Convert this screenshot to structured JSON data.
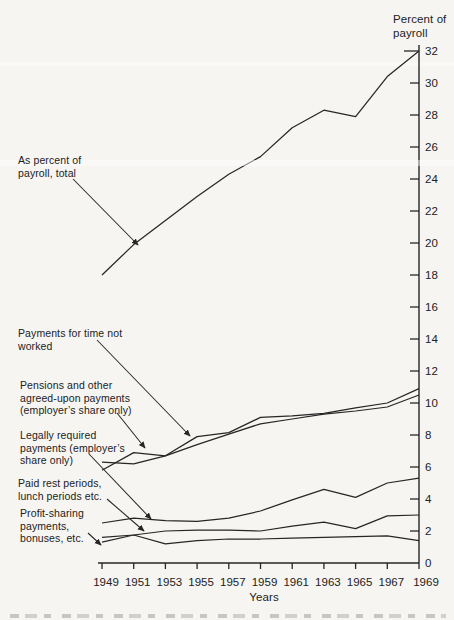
{
  "colors": {
    "ink": "#262626",
    "background": "#f6f5f2"
  },
  "y_axis": {
    "unit_label": "Percent of\npayroll",
    "tick_labels": [
      "32",
      "30",
      "28",
      "26",
      "24",
      "22",
      "20",
      "18",
      "16",
      "14",
      "12",
      "10",
      "8",
      "6",
      "4",
      "2",
      "0"
    ]
  },
  "x_axis": {
    "title": "Years",
    "tick_labels": [
      "1949",
      "1951",
      "1953",
      "1955",
      "1957",
      "1959",
      "1961",
      "1963",
      "1965",
      "1967",
      "1969"
    ]
  },
  "annotations": {
    "total": {
      "text": "As percent of\npayroll, total"
    },
    "time_not_worked": {
      "text": "Payments for time not\nworked"
    },
    "pensions": {
      "text": "Pensions and other\nagreed-upon payments\n(employer’s share only)"
    },
    "legally_required": {
      "text": "Legally required\npayments (employer’s\nshare only)"
    },
    "paid_rest": {
      "text": "Paid rest periods,\nlunch periods etc."
    },
    "profit_sharing": {
      "text": "Profit-sharing\npayments,\nbonuses, etc."
    }
  },
  "chart_data": {
    "type": "line",
    "title": "Percent of payroll",
    "xlabel": "Years",
    "ylabel": "Percent of payroll",
    "grid": false,
    "legend_position": "arrow annotations at left, no legend box",
    "ylim": [
      0,
      32
    ],
    "y_tick_step": 2,
    "x": [
      1949,
      1951,
      1953,
      1955,
      1957,
      1959,
      1961,
      1963,
      1965,
      1967,
      1969
    ],
    "series": [
      {
        "id": "total",
        "name": "As percent of payroll, total",
        "values": [
          18.0,
          19.9,
          21.4,
          22.9,
          24.3,
          25.4,
          27.2,
          28.3,
          27.9,
          30.4,
          32.0
        ]
      },
      {
        "id": "time_not_worked",
        "name": "Payments for time not worked",
        "values": [
          6.3,
          6.2,
          6.7,
          7.9,
          8.15,
          9.1,
          9.2,
          9.35,
          9.7,
          10.0,
          10.9
        ]
      },
      {
        "id": "pensions",
        "name": "Pensions and other agreed-upon payments (employer’s share only)",
        "values": [
          5.8,
          6.9,
          6.7,
          7.4,
          8.05,
          8.7,
          9.0,
          9.3,
          9.5,
          9.75,
          10.5
        ]
      },
      {
        "id": "legally_required",
        "name": "Legally required payments (employer’s share only)",
        "values": [
          2.5,
          2.8,
          2.65,
          2.6,
          2.8,
          3.25,
          3.95,
          4.6,
          4.1,
          5.0,
          5.3
        ]
      },
      {
        "id": "paid_rest",
        "name": "Paid rest periods, lunch periods etc.",
        "values": [
          1.6,
          1.75,
          2.0,
          2.05,
          2.05,
          2.0,
          2.3,
          2.55,
          2.15,
          2.95,
          3.0
        ]
      },
      {
        "id": "profit_sharing",
        "name": "Profit-sharing payments, bonuses, etc.",
        "values": [
          1.3,
          1.75,
          1.2,
          1.4,
          1.5,
          1.5,
          1.55,
          1.6,
          1.65,
          1.7,
          1.4
        ]
      }
    ]
  }
}
